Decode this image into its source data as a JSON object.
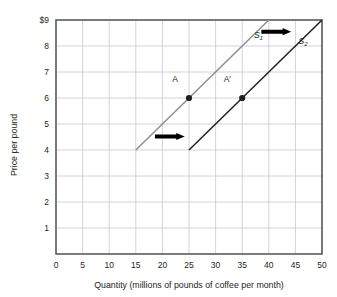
{
  "chart_data": {
    "type": "line",
    "title": "",
    "subtitle": "",
    "xlabel": "Quantity (millions of pounds of coffee per month)",
    "ylabel": "Price per pound",
    "xlim": [
      0,
      50
    ],
    "ylim": [
      0,
      9
    ],
    "xticks": [
      0,
      5,
      10,
      15,
      20,
      25,
      30,
      35,
      40,
      45,
      50
    ],
    "xtick_labels": [
      "0",
      "5",
      "10",
      "15",
      "20",
      "25",
      "30",
      "35",
      "40",
      "45",
      "50"
    ],
    "yticks": [
      1,
      2,
      3,
      4,
      5,
      6,
      7,
      8,
      9
    ],
    "ytick_labels": [
      "1",
      "2",
      "3",
      "4",
      "5",
      "6",
      "7",
      "8",
      "$9"
    ],
    "grid": true,
    "legend_position": "inline-curve-labels",
    "series": [
      {
        "name": "S1",
        "label": "S",
        "subscript": "1",
        "color": "#8e8e8e",
        "x": [
          15,
          40
        ],
        "y": [
          4,
          9
        ],
        "label_x": 37.2,
        "label_y": 8.32
      },
      {
        "name": "S2",
        "label": "S",
        "subscript": "2",
        "color": "#231f20",
        "x": [
          25,
          50
        ],
        "y": [
          4,
          9
        ],
        "label_x": 45.6,
        "label_y": 8.08
      }
    ],
    "points": [
      {
        "name": "A",
        "label": "A",
        "x": 25,
        "y": 6,
        "label_dx": -2.6,
        "label_dy": 0.62,
        "color": "#231f20"
      },
      {
        "name": "A-prime",
        "label": "A'",
        "x": 35,
        "y": 6,
        "label_dx": -2.8,
        "label_dy": 0.62,
        "color": "#231f20"
      }
    ],
    "annotations": [
      {
        "name": "shift-arrow-upper",
        "type": "arrow",
        "direction": "right",
        "x_start": 38.6,
        "x_end": 44.2,
        "y": 8.55,
        "color": "#000000"
      },
      {
        "name": "shift-arrow-lower",
        "type": "arrow",
        "direction": "right",
        "x_start": 18.6,
        "x_end": 24.2,
        "y": 4.52,
        "color": "#000000"
      }
    ],
    "colors": {
      "axis": "#5a5a5a",
      "grid": "#c9c9cd",
      "supply_1": "#8e8e8e",
      "supply_2": "#231f20",
      "text": "#231f20",
      "background": "#ffffff"
    }
  }
}
